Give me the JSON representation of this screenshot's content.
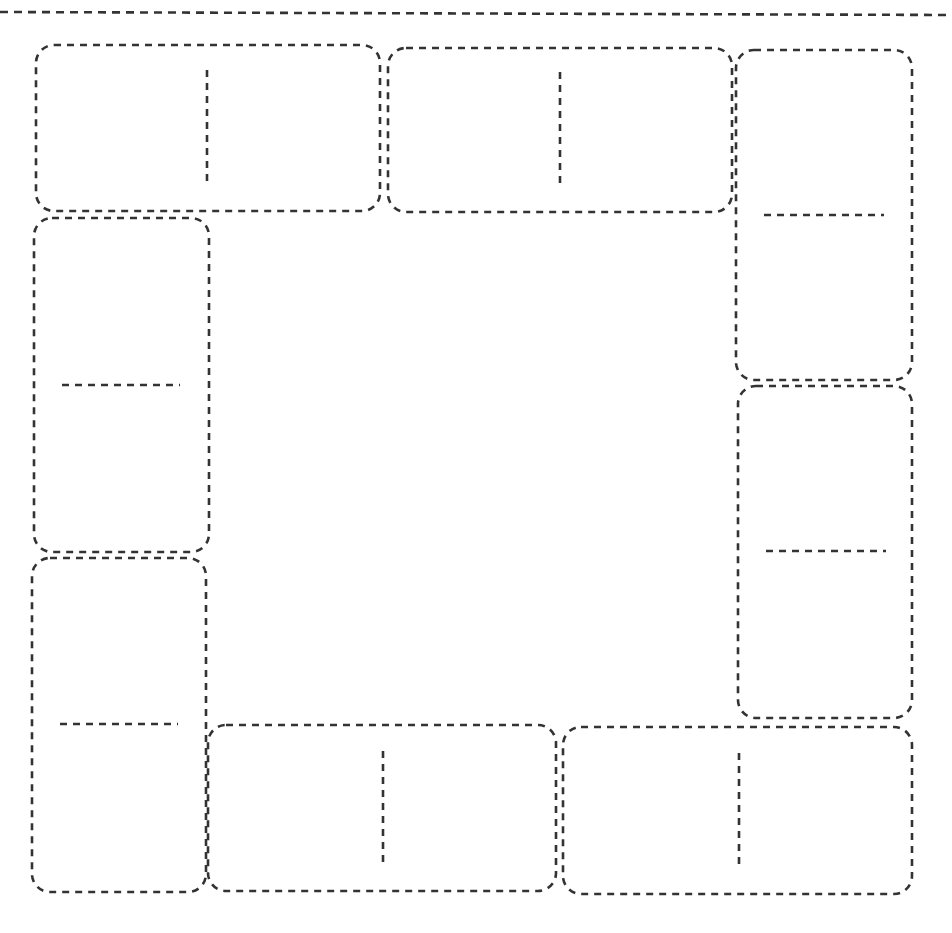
{
  "diagram": {
    "title": "",
    "stroke_color": "#333333",
    "background": "#ffffff",
    "top_rule": {
      "x1": 0,
      "y1": 12,
      "x2": 952,
      "y2": 15
    },
    "tiles": [
      {
        "id": "top-left",
        "orientation": "horizontal",
        "x": 36,
        "y": 45,
        "w": 344,
        "h": 166,
        "divider": {
          "x1": 207,
          "y1": 70,
          "x2": 207,
          "y2": 185
        },
        "pips": [
          0,
          0
        ]
      },
      {
        "id": "top-middle",
        "orientation": "horizontal",
        "x": 388,
        "y": 48,
        "w": 344,
        "h": 164,
        "divider": {
          "x1": 560,
          "y1": 72,
          "x2": 560,
          "y2": 186
        },
        "pips": [
          0,
          0
        ]
      },
      {
        "id": "right-upper",
        "orientation": "vertical",
        "x": 736,
        "y": 50,
        "w": 176,
        "h": 330,
        "divider": {
          "x1": 764,
          "y1": 215,
          "x2": 884,
          "y2": 215
        },
        "pips": [
          0,
          0
        ]
      },
      {
        "id": "right-lower",
        "orientation": "vertical",
        "x": 738,
        "y": 386,
        "w": 174,
        "h": 332,
        "divider": {
          "x1": 766,
          "y1": 551,
          "x2": 886,
          "y2": 551
        },
        "pips": [
          0,
          0
        ]
      },
      {
        "id": "left-upper",
        "orientation": "vertical",
        "x": 34,
        "y": 218,
        "w": 175,
        "h": 334,
        "divider": {
          "x1": 62,
          "y1": 385,
          "x2": 180,
          "y2": 385
        },
        "pips": [
          0,
          0
        ]
      },
      {
        "id": "left-lower",
        "orientation": "vertical",
        "x": 32,
        "y": 558,
        "w": 174,
        "h": 334,
        "divider": {
          "x1": 60,
          "y1": 724,
          "x2": 178,
          "y2": 724
        },
        "pips": [
          0,
          0
        ]
      },
      {
        "id": "bottom-middle",
        "orientation": "horizontal",
        "x": 208,
        "y": 725,
        "w": 348,
        "h": 166,
        "divider": {
          "x1": 383,
          "y1": 751,
          "x2": 383,
          "y2": 868
        },
        "pips": [
          0,
          0
        ]
      },
      {
        "id": "bottom-right",
        "orientation": "horizontal",
        "x": 563,
        "y": 727,
        "w": 349,
        "h": 167,
        "divider": {
          "x1": 739,
          "y1": 753,
          "x2": 739,
          "y2": 870
        },
        "pips": [
          0,
          0
        ]
      }
    ]
  }
}
